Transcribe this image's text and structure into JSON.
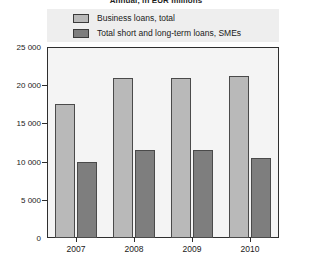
{
  "chart_data": {
    "type": "bar",
    "title": "",
    "subtitle": "Annual, in EUR millions",
    "xlabel": "",
    "ylabel": "",
    "categories": [
      "2007",
      "2008",
      "2009",
      "2010"
    ],
    "series": [
      {
        "name": "Business loans, total",
        "color": "#b9b9b9",
        "values": [
          17500,
          21000,
          21000,
          21200
        ]
      },
      {
        "name": "Total short and long-term loans, SMEs",
        "color": "#7e7e7e",
        "values": [
          10000,
          11500,
          11500,
          10500
        ]
      }
    ],
    "ylim": [
      0,
      25000
    ],
    "ytick_values": [
      0,
      5000,
      10000,
      15000,
      20000,
      25000
    ],
    "ytick_labels": [
      "0",
      "5 000",
      "10 000",
      "15 000",
      "20 000",
      "25 000"
    ],
    "grid": false,
    "legend_position": "top"
  }
}
